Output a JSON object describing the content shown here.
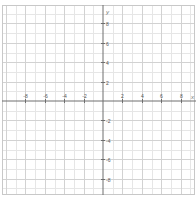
{
  "graph": {
    "title": "Coordinate plane",
    "x_axis_label": "x",
    "y_axis_label": "y",
    "x_range": [
      -10,
      10
    ],
    "y_range": [
      -10,
      10
    ],
    "major_step": 2,
    "minor_step": 1,
    "x_ticks": [
      -8,
      -6,
      -4,
      -2,
      2,
      4,
      6,
      8
    ],
    "y_ticks": [
      8,
      6,
      4,
      2,
      -2,
      -4,
      -6,
      -8
    ],
    "x_tick_labels": [
      "-8",
      "-6",
      "-4",
      "-2",
      "2",
      "4",
      "6",
      "8"
    ],
    "y_tick_labels": [
      "8",
      "6",
      "4",
      "2",
      "-2",
      "-4",
      "-6",
      "-8"
    ],
    "colors": {
      "background": "#ffffff",
      "minor_grid": "#e6e6e6",
      "major_grid": "#d2d2d2",
      "axis": "#6e6e6e",
      "border": "#c8c8c8",
      "label": "#555555"
    }
  }
}
